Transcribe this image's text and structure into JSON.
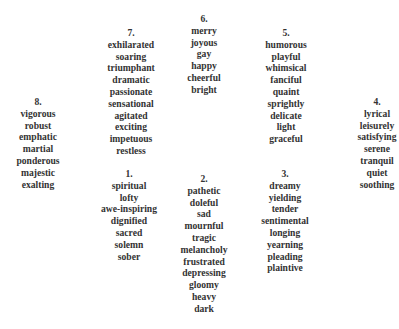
{
  "clusters": [
    {
      "number": "1.",
      "words": [
        "spiritual",
        "lofty",
        "awe-inspiring",
        "dignified",
        "sacred",
        "solemn",
        "sober"
      ]
    },
    {
      "number": "2.",
      "words": [
        "pathetic",
        "doleful",
        "sad",
        "mournful",
        "tragic",
        "melancholy",
        "frustrated",
        "depressing",
        "gloomy",
        "heavy",
        "dark"
      ]
    },
    {
      "number": "3.",
      "words": [
        "dreamy",
        "yielding",
        "tender",
        "sentimental",
        "longing",
        "yearning",
        "pleading",
        "plaintive"
      ]
    },
    {
      "number": "4.",
      "words": [
        "lyrical",
        "leisurely",
        "satisfying",
        "serene",
        "tranquil",
        "quiet",
        "soothing"
      ]
    },
    {
      "number": "5.",
      "words": [
        "humorous",
        "playful",
        "whimsical",
        "fanciful",
        "quaint",
        "sprightly",
        "delicate",
        "light",
        "graceful"
      ]
    },
    {
      "number": "6.",
      "words": [
        "merry",
        "joyous",
        "gay",
        "happy",
        "cheerful",
        "bright"
      ]
    },
    {
      "number": "7.",
      "words": [
        "exhilarated",
        "soaring",
        "triumphant",
        "dramatic",
        "passionate",
        "sensational",
        "agitated",
        "exciting",
        "impetuous",
        "restless"
      ]
    },
    {
      "number": "8.",
      "words": [
        "vigorous",
        "robust",
        "emphatic",
        "martial",
        "ponderous",
        "majestic",
        "exalting"
      ]
    }
  ]
}
